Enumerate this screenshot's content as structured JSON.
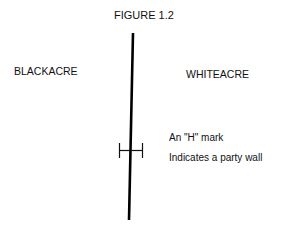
{
  "figure": {
    "title": "FIGURE 1.2",
    "left_parcel": "BLACKACRE",
    "right_parcel": "WHITEACRE",
    "annotation_line1": "An \"H\" mark",
    "annotation_line2": "Indicates a party wall"
  },
  "icons": {
    "boundary_line": "vertical-boundary-line",
    "party_wall_mark": "h-mark-symbol"
  }
}
